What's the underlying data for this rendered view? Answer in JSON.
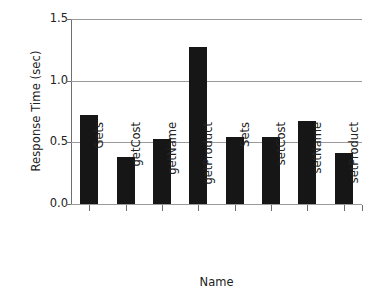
{
  "chart_data": {
    "type": "bar",
    "title": "",
    "xlabel": "Name",
    "ylabel": "Response Time (sec)",
    "categories": [
      "Gets",
      "getCost",
      "getName",
      "getProduct",
      "Sets",
      "setCost",
      "setName",
      "setProduct"
    ],
    "values": [
      0.72,
      0.38,
      0.53,
      1.27,
      0.54,
      0.54,
      0.67,
      0.41
    ],
    "ylim": [
      0.0,
      1.5
    ],
    "yticks": [
      "0.0",
      "0.5",
      "1.0",
      "1.5"
    ],
    "ytick_values": [
      0.0,
      0.5,
      1.0,
      1.5
    ],
    "grid": true,
    "legend": "none",
    "bar_color": "#161616",
    "gridline_color": "#9a9a9a",
    "axis_color": "#6f6f6f",
    "background_color": "#ffffff"
  }
}
